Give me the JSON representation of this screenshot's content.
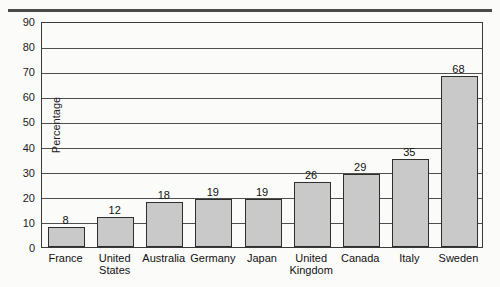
{
  "chart_data": {
    "type": "bar",
    "title": "",
    "xlabel": "",
    "ylabel": "Percentage",
    "ylim": [
      0,
      90
    ],
    "ytick_step": 10,
    "yticks": [
      0,
      10,
      20,
      30,
      40,
      50,
      60,
      70,
      80,
      90
    ],
    "grid": true,
    "legend": null,
    "value_labels_shown": true,
    "categories": [
      "France",
      "United States",
      "Australia",
      "Germany",
      "Japan",
      "United Kingdom",
      "Canada",
      "Italy",
      "Sweden"
    ],
    "category_labels_wrapped": [
      "France",
      "United\nStates",
      "Australia",
      "Germany",
      "Japan",
      "United\nKingdom",
      "Canada",
      "Italy",
      "Sweden"
    ],
    "values": [
      8,
      12,
      18,
      19,
      19,
      26,
      29,
      35,
      68
    ],
    "value_label_texts": [
      "8",
      "12",
      "18",
      "19",
      "19",
      "26",
      "29",
      "35",
      "68"
    ],
    "colors": {
      "bar_fill": "#c9c9c9",
      "bar_stroke": "#2e2e2e",
      "gridline": "#4f4f4f",
      "axis": "#3a3a3a",
      "text": "#111111",
      "background": "#fbfbf9",
      "top_rule": "#4a4a4a"
    }
  }
}
